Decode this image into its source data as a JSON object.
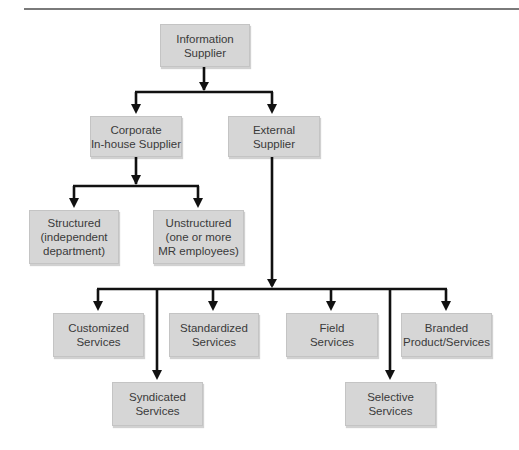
{
  "diagram": {
    "type": "hierarchy",
    "colors": {
      "box_fill": "#d6d6d6",
      "box_border": "#c4c4c4",
      "text": "#3a3a3a",
      "connector": "#111111",
      "top_rule": "#7a7a7a"
    },
    "nodes": {
      "root": {
        "lines": [
          "Information",
          "Supplier"
        ]
      },
      "corporate": {
        "lines": [
          "Corporate",
          "In-house Supplier"
        ]
      },
      "external": {
        "lines": [
          "External",
          "Supplier"
        ]
      },
      "structured": {
        "lines": [
          "Structured",
          "(independent",
          "department)"
        ]
      },
      "unstructured": {
        "lines": [
          "Unstructured",
          "(one or more",
          "MR employees)"
        ]
      },
      "customized": {
        "lines": [
          "Customized",
          "Services"
        ]
      },
      "syndicated": {
        "lines": [
          "Syndicated",
          "Services"
        ]
      },
      "standardized": {
        "lines": [
          "Standardized",
          "Services"
        ]
      },
      "field": {
        "lines": [
          "Field",
          "Services"
        ]
      },
      "selective": {
        "lines": [
          "Selective",
          "Services"
        ]
      },
      "branded": {
        "lines": [
          "Branded",
          "Product/Services"
        ]
      }
    },
    "edges": [
      {
        "from": "Information Supplier",
        "to": "Corporate In-house Supplier"
      },
      {
        "from": "Information Supplier",
        "to": "External Supplier"
      },
      {
        "from": "Corporate In-house Supplier",
        "to": "Structured (independent department)"
      },
      {
        "from": "Corporate In-house Supplier",
        "to": "Unstructured (one or more MR employees)"
      },
      {
        "from": "External Supplier",
        "to": "Customized Services"
      },
      {
        "from": "External Supplier",
        "to": "Syndicated Services"
      },
      {
        "from": "External Supplier",
        "to": "Standardized Services"
      },
      {
        "from": "External Supplier",
        "to": "Field Services"
      },
      {
        "from": "External Supplier",
        "to": "Selective Services"
      },
      {
        "from": "External Supplier",
        "to": "Branded Product/Services"
      }
    ]
  }
}
